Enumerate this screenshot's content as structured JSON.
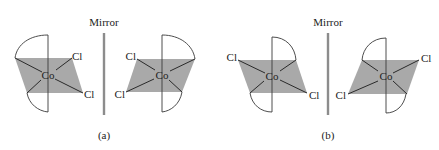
{
  "figure": {
    "colors": {
      "plane_fill": "#a9a9a9",
      "bond": "#2a2a2a",
      "mirror": "#8c8c8c",
      "text": "#222222"
    },
    "panels": [
      {
        "id": "a",
        "label": "(a)",
        "mirror_label": "Mirror",
        "molecules": [
          {
            "center_label": "Co",
            "ligands": [
              "Cl",
              "Cl"
            ],
            "ligand_positions": [
              "upper-right",
              "lower-right"
            ]
          },
          {
            "center_label": "Co",
            "ligands": [
              "Cl",
              "Cl"
            ],
            "ligand_positions": [
              "upper-left",
              "lower-left"
            ]
          }
        ]
      },
      {
        "id": "b",
        "label": "(b)",
        "mirror_label": "Mirror",
        "molecules": [
          {
            "center_label": "Co",
            "ligands": [
              "Cl",
              "Cl"
            ],
            "ligand_positions": [
              "upper-left",
              "lower-right"
            ]
          },
          {
            "center_label": "Co",
            "ligands": [
              "Cl",
              "Cl"
            ],
            "ligand_positions": [
              "upper-right",
              "lower-left"
            ]
          }
        ]
      }
    ]
  }
}
